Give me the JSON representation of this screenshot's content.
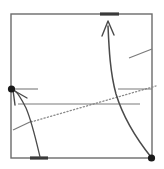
{
  "figure": {
    "title": "",
    "width": 164,
    "height": 169,
    "background_color": "#ffffff"
  },
  "colors": {
    "frame_stroke": "#6b6b6b",
    "curve_stroke": "#4a4a4a",
    "thin_stroke": "#7a7a7a",
    "dotted_stroke": "#8a8a8a",
    "node_fill": "#1a1a1a",
    "thick_mark_fill": "#3a3a3a",
    "background": "#ffffff"
  },
  "frame": {
    "name": "bounding-square",
    "left": 11,
    "top": 14,
    "right": 152,
    "bottom": 158,
    "stroke_width": 1.4
  },
  "boundary_marks": [
    {
      "name": "top-edge-thick-mark",
      "edge": "top",
      "x1": 100,
      "x2": 119,
      "y": 14,
      "stroke_width": 3.2
    },
    {
      "name": "bottom-edge-thick-mark",
      "edge": "bottom",
      "x1": 30,
      "x2": 48,
      "y": 158,
      "stroke_width": 3.2
    }
  ],
  "nodes": [
    {
      "name": "left-boundary-node",
      "cx": 11.5,
      "cy": 89,
      "r": 3.6,
      "fill": "#1a1a1a"
    },
    {
      "name": "bottom-right-corner-node",
      "cx": 151.5,
      "cy": 158,
      "r": 3.6,
      "fill": "#1a1a1a"
    }
  ],
  "curves": [
    {
      "name": "main-rising-trajectory",
      "path": "M 151 157 C 139 142 124 120 116 94 C 110 72 109 48 108 26",
      "stroke_width": 1.5,
      "arrow": "end"
    },
    {
      "name": "lower-left-trajectory",
      "path": "M 40 157 C 36 140 32 122 26 108 C 22 100 19 94 15 91",
      "stroke_width": 1.3,
      "arrow": "end"
    }
  ],
  "arrowheads": [
    {
      "name": "up-arrowhead-top",
      "tip_x": 108,
      "tip_y": 21,
      "left_x": 102,
      "left_y": 36,
      "right_x": 114,
      "right_y": 35
    },
    {
      "name": "upleft-arrowhead-left-node",
      "tip_x": 13,
      "tip_y": 90,
      "left_x": 15,
      "left_y": 105,
      "right_x": 27,
      "right_y": 98
    }
  ],
  "straight_lines": [
    {
      "name": "node-horizontal-tick",
      "x1": 12,
      "y1": 89,
      "x2": 38,
      "y2": 89,
      "stroke_width": 1.1,
      "style": "solid"
    },
    {
      "name": "mid-horizontal-line",
      "x1": 18,
      "y1": 104,
      "x2": 140,
      "y2": 104,
      "stroke_width": 1.1,
      "style": "solid"
    },
    {
      "name": "right-upper-horizontal-line",
      "x1": 118,
      "y1": 89,
      "x2": 152,
      "y2": 89,
      "stroke_width": 1.1,
      "style": "solid"
    },
    {
      "name": "upper-right-diagonal-tick",
      "x1": 129,
      "y1": 58,
      "x2": 152,
      "y2": 49,
      "stroke_width": 1.2,
      "style": "solid"
    },
    {
      "name": "lower-left-diagonal-tick",
      "x1": 13,
      "y1": 130,
      "x2": 32,
      "y2": 121,
      "stroke_width": 1.2,
      "style": "solid"
    }
  ],
  "dotted_line": {
    "name": "dotted-separatrix",
    "x1": 31,
    "y1": 122,
    "x2": 156,
    "y2": 86,
    "stroke_width": 1.3,
    "dash_pattern": "1.2 2.2",
    "style": "dotted"
  }
}
